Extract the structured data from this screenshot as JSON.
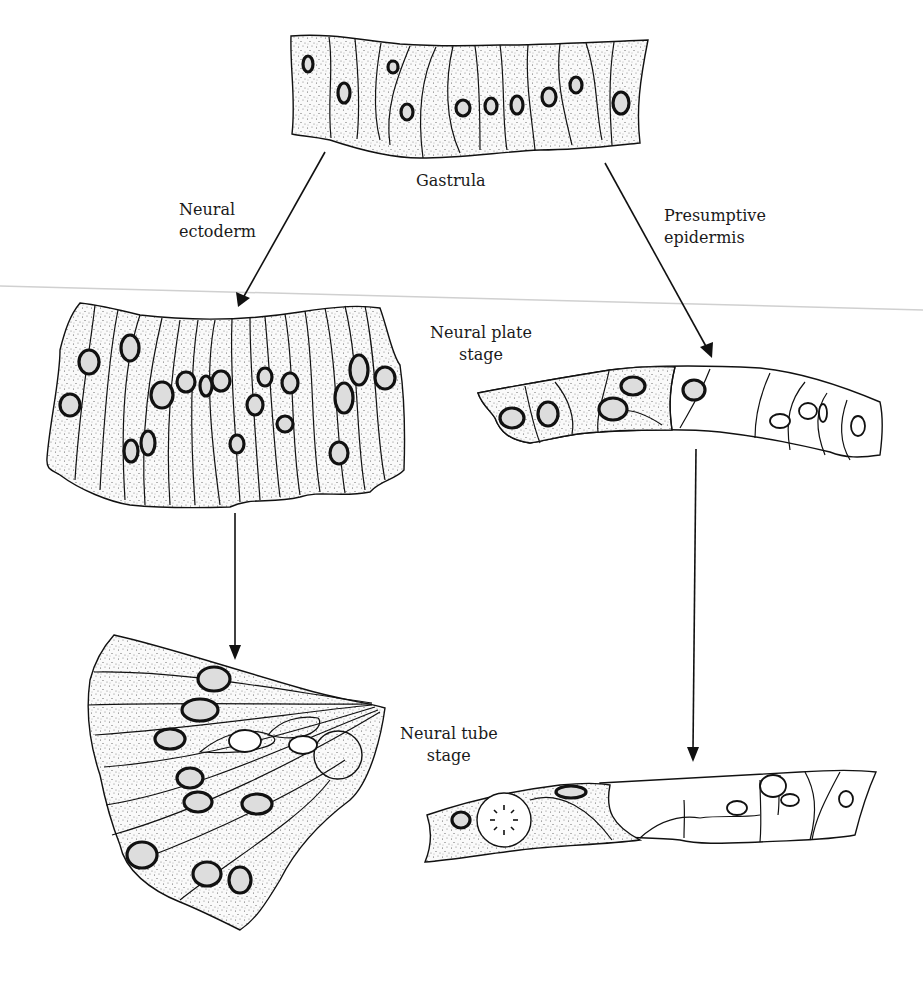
{
  "figure": {
    "labels": {
      "gastrula": "Gastrula",
      "neural_ectoderm": [
        "Neural",
        "ectoderm"
      ],
      "presumptive_epidermis": [
        "Presumptive",
        "epidermis"
      ],
      "neural_plate_stage": [
        "Neural plate",
        "stage"
      ],
      "neural_tube_stage": [
        "Neural tube",
        "stage"
      ]
    },
    "stages": [
      {
        "id": "gastrula",
        "position": "top-center",
        "cell_count": 13
      },
      {
        "id": "neural-plate",
        "position": "middle-left",
        "cell_count": 18
      },
      {
        "id": "presumptive-epidermis",
        "position": "middle-right",
        "cell_count": 12
      },
      {
        "id": "neural-tube",
        "position": "bottom-left",
        "cell_count": 12
      },
      {
        "id": "epidermis",
        "position": "bottom-right",
        "cell_count": 9
      }
    ],
    "arrows": [
      {
        "from": "gastrula",
        "to": "neural-plate",
        "label": "Neural ectoderm"
      },
      {
        "from": "gastrula",
        "to": "presumptive-epidermis",
        "label": "Presumptive epidermis"
      },
      {
        "from": "neural-plate",
        "to": "neural-tube"
      },
      {
        "from": "presumptive-epidermis",
        "to": "epidermis"
      }
    ],
    "colors": {
      "ink": "#111111",
      "background": "#ffffff",
      "scan_line": "#d0d0d0"
    }
  }
}
